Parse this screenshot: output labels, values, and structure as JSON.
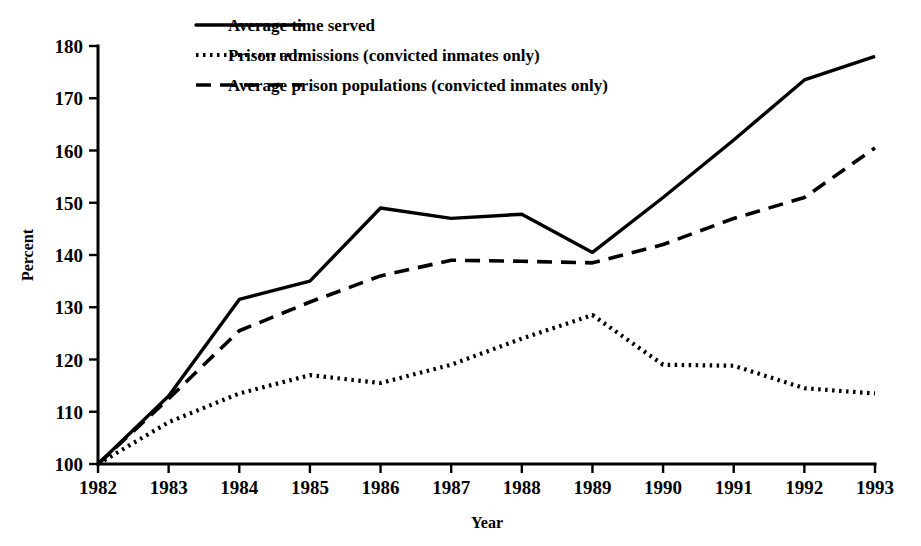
{
  "chart_data": {
    "type": "line",
    "title": "",
    "xlabel": "Year",
    "ylabel": "Percent",
    "x": [
      1982,
      1983,
      1984,
      1985,
      1986,
      1987,
      1988,
      1989,
      1990,
      1991,
      1992,
      1993
    ],
    "xtick_labels": [
      "1982",
      "1983",
      "1984",
      "1985",
      "1986",
      "1987",
      "1988",
      "1989",
      "1990",
      "1991",
      "1992",
      "1993"
    ],
    "ytick_labels": [
      "100",
      "110",
      "120",
      "130",
      "140",
      "150",
      "160",
      "170",
      "180"
    ],
    "yticks": [
      100,
      110,
      120,
      130,
      140,
      150,
      160,
      170,
      180
    ],
    "ylim": [
      100,
      180
    ],
    "xlim": [
      1982,
      1993
    ],
    "grid": false,
    "legend_position": "top-left",
    "series": [
      {
        "name": "Average time served",
        "style": "solid",
        "color": "#000000",
        "values": [
          100,
          113,
          131.5,
          135,
          149,
          147,
          147.8,
          140.5,
          151,
          162,
          173.5,
          178
        ]
      },
      {
        "name": "Prison admissions (convicted inmates only)",
        "style": "dotted",
        "color": "#000000",
        "values": [
          100,
          108,
          113.5,
          117,
          115.5,
          119,
          124,
          128.5,
          119,
          118.8,
          114.5,
          113.5
        ]
      },
      {
        "name": "Average prison populations (convicted inmates only)",
        "style": "dashed",
        "color": "#000000",
        "values": [
          100,
          112.5,
          125.5,
          131,
          136,
          139,
          138.8,
          138.5,
          142,
          147,
          151,
          160.5
        ]
      }
    ]
  },
  "legend": {
    "items": [
      {
        "label": "Average time served",
        "style": "solid"
      },
      {
        "label": "Prison admissions (convicted inmates only)",
        "style": "dotted"
      },
      {
        "label": "Average prison populations (convicted inmates only)",
        "style": "dashed"
      }
    ]
  },
  "axes": {
    "y_title": "Percent",
    "x_title": "Year"
  }
}
